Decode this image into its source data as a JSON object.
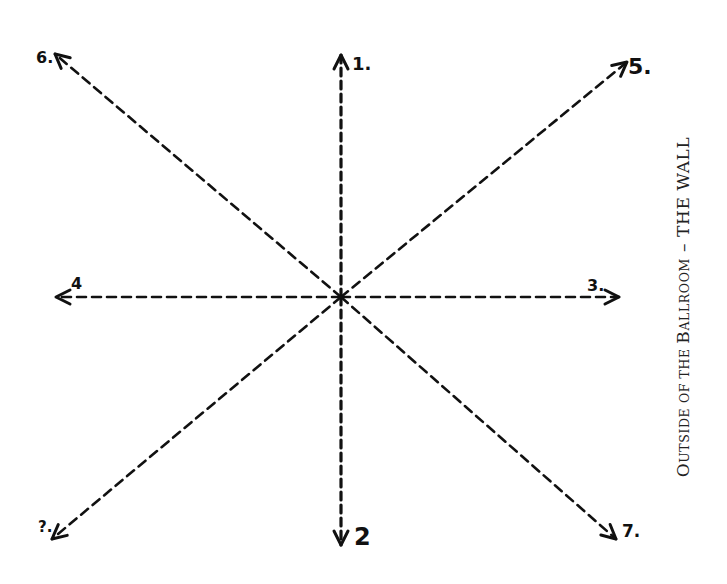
{
  "diagram": {
    "center": {
      "x": 341,
      "y": 297
    },
    "directions": [
      {
        "id": "1",
        "label": "1.",
        "direction": "up",
        "end": {
          "x": 341,
          "y": 55
        },
        "label_pos": {
          "x": 352,
          "y": 70
        },
        "font_size": 18
      },
      {
        "id": "2",
        "label": "2",
        "direction": "down",
        "end": {
          "x": 341,
          "y": 545
        },
        "label_pos": {
          "x": 354,
          "y": 545
        },
        "font_size": 24
      },
      {
        "id": "3",
        "label": "3.",
        "direction": "right",
        "end": {
          "x": 619,
          "y": 297
        },
        "label_pos": {
          "x": 587,
          "y": 291
        },
        "font_size": 16
      },
      {
        "id": "4",
        "label": "4",
        "direction": "left",
        "end": {
          "x": 56,
          "y": 297
        },
        "label_pos": {
          "x": 71,
          "y": 289
        },
        "font_size": 16
      },
      {
        "id": "5",
        "label": "5.",
        "direction": "up-right",
        "end": {
          "x": 627,
          "y": 62
        },
        "label_pos": {
          "x": 628,
          "y": 74
        },
        "font_size": 22
      },
      {
        "id": "6",
        "label": "6.",
        "direction": "up-left",
        "end": {
          "x": 55,
          "y": 54
        },
        "label_pos": {
          "x": 36,
          "y": 63
        },
        "font_size": 16
      },
      {
        "id": "7",
        "label": "7.",
        "direction": "down-right",
        "end": {
          "x": 616,
          "y": 539
        },
        "label_pos": {
          "x": 622,
          "y": 537
        },
        "font_size": 17
      },
      {
        "id": "8",
        "label": "?.",
        "direction": "down-left",
        "end": {
          "x": 52,
          "y": 539
        },
        "label_pos": {
          "x": 38,
          "y": 532
        },
        "font_size": 15
      }
    ]
  },
  "caption": {
    "first_letter": "O",
    "first_rest": "UTSIDE OF THE ",
    "second_letter": "B",
    "second_rest": "ALLROOM",
    "separator": " – ",
    "tail": "THE WALL"
  }
}
